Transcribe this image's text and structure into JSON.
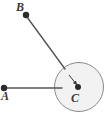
{
  "figure": {
    "width": 106,
    "height": 119,
    "background_color": "#ffffff",
    "stroke_color": "#6f6f6f",
    "point_color": "#2b2b2b",
    "label_color": "#3a3a3a",
    "circle_fill_color": "#f2f2f2"
  },
  "points": [
    {
      "id": "A",
      "label": "A",
      "x": 4,
      "y": 88,
      "label_x": 1,
      "label_y": 90,
      "dot_radius": 3.2
    },
    {
      "id": "B",
      "label": "B",
      "x": 26,
      "y": 15,
      "label_x": 16,
      "label_y": 1,
      "dot_radius": 3.2
    },
    {
      "id": "C",
      "label": "C",
      "x": 78,
      "y": 87,
      "label_x": 71,
      "label_y": 92,
      "dot_radius": 3.0
    }
  ],
  "circle": {
    "center_x": 79,
    "center_y": 87,
    "radius": 24.5,
    "fill": "#f2f2f2",
    "stroke": "#8a8a8a",
    "stroke_width": 1
  },
  "segments": [
    {
      "id": "segment-A-to-circle",
      "from": "A",
      "x1": 5,
      "y1": 88,
      "x2": 62,
      "y2": 88,
      "stroke": "#555555",
      "stroke_width": 1.4
    },
    {
      "id": "segment-B-to-circle",
      "from": "B",
      "x1": 27,
      "y1": 17,
      "x2": 65,
      "y2": 69,
      "stroke": "#555555",
      "stroke_width": 1.4
    }
  ],
  "radius_arrow": {
    "id": "radius-arrow-to-center",
    "x1": 69,
    "y1": 75,
    "x2": 77,
    "y2": 85,
    "stroke": "#3a3a3a",
    "stroke_width": 1,
    "arrowhead": "filled-triangle"
  }
}
